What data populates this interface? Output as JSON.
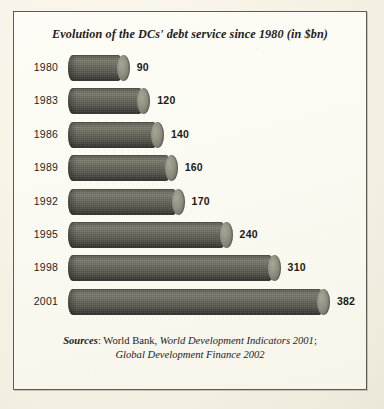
{
  "figure": {
    "title": "Evolution of the DCs' debt service since 1980 (in $bn)",
    "frame_color": "#5d5c50",
    "background_color": "#fbfaf2",
    "bar_color": "#57554c",
    "bar_cap_color": "#908e80"
  },
  "sources": {
    "lead": "Sources",
    "colon": ": ",
    "org": "World Bank, ",
    "pub1": "World Development Indicators 2001",
    "semicolon": ";",
    "pub2": "Global Development Finance 2002"
  },
  "chart_data": {
    "type": "bar",
    "orientation": "horizontal",
    "title": "Evolution of the DCs' debt service since 1980 (in $bn)",
    "xlabel": "",
    "ylabel": "",
    "unit": "$bn",
    "grid": false,
    "legend": "none",
    "xlim": [
      0,
      382
    ],
    "categories": [
      "1980",
      "1983",
      "1986",
      "1989",
      "1992",
      "1995",
      "1998",
      "2001"
    ],
    "values": [
      90,
      120,
      140,
      160,
      170,
      240,
      310,
      382
    ],
    "value_labels": [
      "90",
      "120",
      "140",
      "160",
      "170",
      "240",
      "310",
      "382"
    ]
  }
}
